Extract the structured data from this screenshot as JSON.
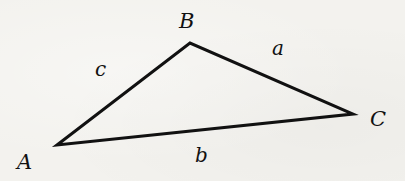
{
  "diagram": {
    "type": "triangle",
    "colors": {
      "background": "#f3f2ee",
      "stroke": "#111111",
      "text": "#111111"
    },
    "vertices": [
      {
        "id": "A",
        "label": "A",
        "x": 57,
        "y": 145
      },
      {
        "id": "B",
        "label": "B",
        "x": 190,
        "y": 43
      },
      {
        "id": "C",
        "label": "C",
        "x": 353,
        "y": 114
      }
    ],
    "sides": [
      {
        "id": "a",
        "label": "a",
        "from": "B",
        "to": "C"
      },
      {
        "id": "b",
        "label": "b",
        "from": "A",
        "to": "C"
      },
      {
        "id": "c",
        "label": "c",
        "from": "A",
        "to": "B"
      }
    ]
  }
}
